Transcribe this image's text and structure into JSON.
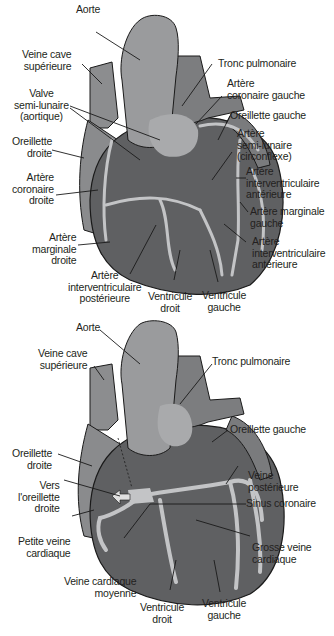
{
  "colors": {
    "background": "#ffffff",
    "heart_dark": "#5f6062",
    "heart_mid": "#7a7b7d",
    "heart_light": "#9a9b9d",
    "vessel_light": "#c3c4c6",
    "outline": "#1a1a1a",
    "label_text": "#231f20"
  },
  "top_diagram": {
    "title": "Coronary arteries (anterior view)",
    "labels": {
      "aorte": "Aorte",
      "veine_cave": "Veine cave\nsupérieure",
      "valve": "Valve\nsemi-lunaire\n(aortique)",
      "oreillette_droite": "Oreillette\ndroite",
      "coronaire_droite": "Artère\ncoronaire\ndroite",
      "marginale_droite": "Artère\nmarginale\ndroite",
      "interv_posterieure": "Artère\ninterventriculaire\npostérieure",
      "ventricule_droit": "Ventricule\ndroit",
      "ventricule_gauche": "Ventricule\ngauche",
      "tronc_pulmonaire": "Tronc pulmonaire",
      "coronaire_gauche": "Artère\ncoronaire gauche",
      "oreillette_gauche": "Oreillette gauche",
      "circonflexe": "Artère\nsemi-lunaire\n(circonflexe)",
      "interv_anterieure_1": "Artère\ninterventriculaire\nantérieure",
      "marginale_gauche": "Artère marginale\ngauche",
      "interv_anterieure_2": "Artère\ninterventriculaire\nantérieure"
    }
  },
  "bottom_diagram": {
    "title": "Cardiac veins (anterior view)",
    "labels": {
      "aorte": "Aorte",
      "veine_cave": "Veine cave\nsupérieure",
      "tronc_pulmonaire": "Tronc pulmonaire",
      "oreillette_gauche": "Oreillette gauche",
      "oreillette_droite": "Oreillette\ndroite",
      "vers_oreillette": "Vers\nl'oreillette\ndroite",
      "veine_posterieure": "Veine\npostérieure",
      "sinus_coronaire": "Sinus coronaire",
      "petite_veine": "Petite veine\ncardiaque",
      "grosse_veine": "Grosse veine\ncardiaque",
      "veine_moyenne": "Veine cardiaque\nmoyenne",
      "ventricule_droit": "Ventricule\ndroit",
      "ventricule_gauche": "Ventricule\ngauche"
    }
  }
}
